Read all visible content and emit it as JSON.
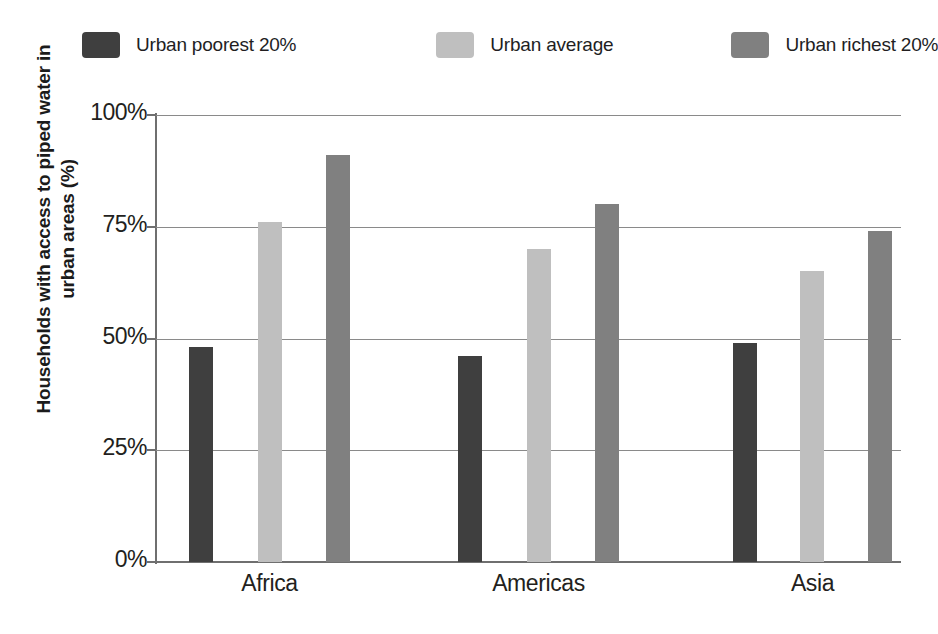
{
  "chart_data": {
    "type": "bar",
    "title": "",
    "xlabel": "",
    "ylabel": "Households with access to piped water in urban areas (%)",
    "ylabel_line1": "Households with access to piped water in",
    "ylabel_line2": "urban areas (%)",
    "categories": [
      "Africa",
      "Americas",
      "Asia"
    ],
    "ylim": [
      0,
      100
    ],
    "ytick_labels": [
      "0%",
      "25%",
      "50%",
      "75%",
      "100%"
    ],
    "ytick_values": [
      0,
      25,
      50,
      75,
      100
    ],
    "grid": true,
    "legend_position": "top",
    "series": [
      {
        "name": "Urban poorest 20%",
        "color": "#3f3f3f",
        "values": [
          48,
          46,
          49
        ]
      },
      {
        "name": "Urban average",
        "color": "#bfbfbf",
        "values": [
          76,
          70,
          65
        ]
      },
      {
        "name": "Urban richest 20%",
        "color": "#808080",
        "values": [
          91,
          80,
          74
        ]
      }
    ]
  },
  "colors": {
    "axis": "#6f6f6f",
    "grid": "#8a8a8a",
    "text": "#231f20",
    "background": "#ffffff"
  }
}
